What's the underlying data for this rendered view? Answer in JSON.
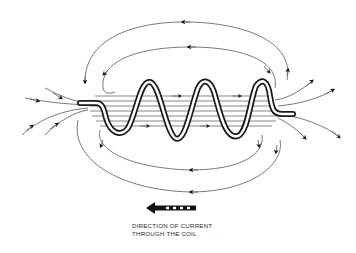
{
  "figure": {
    "type": "solenoid magnetic field diagram",
    "caption": {
      "line1": "DIRECTION OF CURRENT",
      "line2": "THROUGH THE COIL"
    },
    "elements": {
      "coil": "helical coil with 3 visible turns and straight lead ends",
      "internal_field_lines": "parallel horizontal lines through coil with rightward arrows",
      "external_field_lines": "closed loops above and below coil with leftward arrows",
      "left_end_lines": "field lines converging into left end",
      "right_end_lines": "field lines diverging from right end",
      "current_arrow": "leftward arrow with dashed tail"
    },
    "colors": {
      "line": "#444444",
      "coil": "#1a1a1a",
      "background": "#ffffff"
    }
  }
}
